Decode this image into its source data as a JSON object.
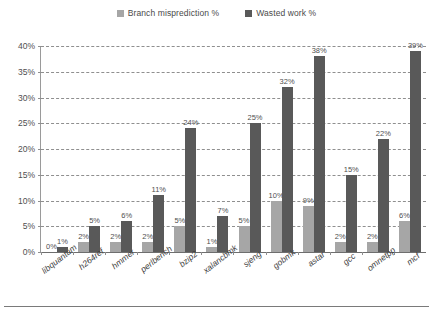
{
  "legend": {
    "position": "top-center",
    "entries": [
      {
        "label": "Branch misprediction %",
        "color": "#a6a6a6"
      },
      {
        "label": "Wasted work %",
        "color": "#595959"
      }
    ]
  },
  "axes": {
    "y_ticks": [
      "0%",
      "5%",
      "10%",
      "15%",
      "20%",
      "25%",
      "30%",
      "35%",
      "40%"
    ],
    "y_min": 0,
    "y_max": 40,
    "y_step": 5
  },
  "chart_data": {
    "type": "bar",
    "title": "",
    "subtitle": "",
    "xlabel": "",
    "ylabel": "",
    "ylim": [
      0,
      40
    ],
    "ytick_step": 5,
    "grid": true,
    "legend_position": "top-center",
    "categories": [
      "libquantum",
      "h264ref",
      "hmmer",
      "perlbench",
      "bzip2",
      "xalancbmk",
      "sjeng",
      "gobmk",
      "astar",
      "gcc",
      "omnetpp",
      "mcf"
    ],
    "series": [
      {
        "name": "Branch misprediction %",
        "color": "#a6a6a6",
        "values": [
          0,
          2,
          2,
          2,
          5,
          1,
          5,
          10,
          9,
          2,
          2,
          6
        ],
        "labels": [
          "0%",
          "2%",
          "2%",
          "2%",
          "5%",
          "1%",
          "5%",
          "10%",
          "9%",
          "2%",
          "2%",
          "6%"
        ]
      },
      {
        "name": "Wasted work %",
        "color": "#595959",
        "values": [
          1,
          5,
          6,
          11,
          24,
          7,
          25,
          32,
          38,
          15,
          22,
          39
        ],
        "labels": [
          "1%",
          "5%",
          "6%",
          "11%",
          "24%",
          "7%",
          "25%",
          "32%",
          "38%",
          "15%",
          "22%",
          "39%"
        ]
      }
    ]
  }
}
